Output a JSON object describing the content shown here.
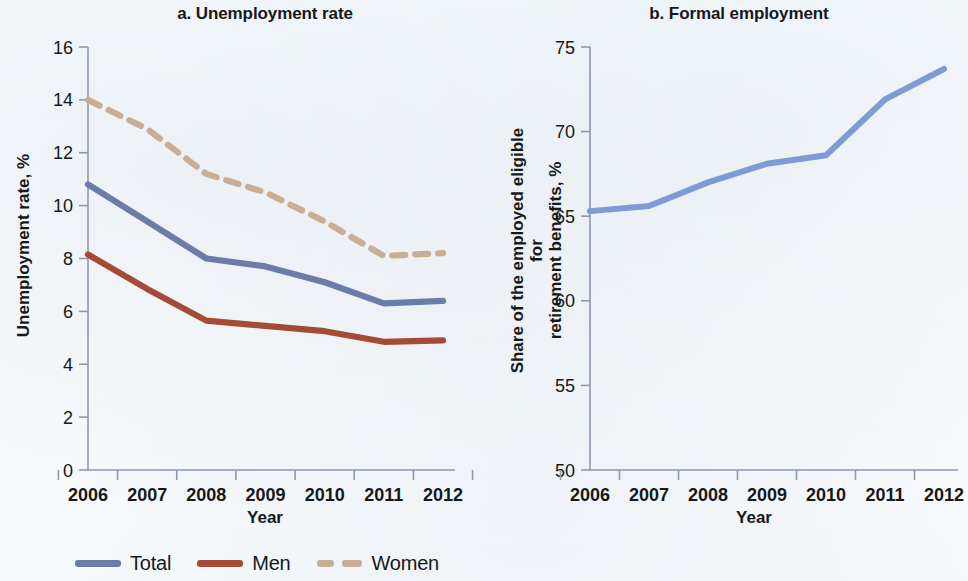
{
  "figure": {
    "background_color": "#fbfcfd",
    "x_axis_label": "Year"
  },
  "panels": [
    {
      "id": "a",
      "title": "a. Unemployment rate",
      "ylabel": "Unemployment rate, %",
      "xlabel": "Year"
    },
    {
      "id": "b",
      "title": "b. Formal employment",
      "ylabel_line1": "Share of the employed eligible for",
      "ylabel_line2": "retirement benefits, %",
      "xlabel": "Year"
    }
  ],
  "legend": {
    "items": [
      {
        "label": "Total",
        "color": "#6B7CA8",
        "style": "solid"
      },
      {
        "label": "Men",
        "color": "#A44A35",
        "style": "solid"
      },
      {
        "label": "Women",
        "color": "#C9AE96",
        "style": "dashed"
      }
    ]
  },
  "chart_data": [
    {
      "type": "line",
      "title": "a. Unemployment rate",
      "xlabel": "Year",
      "ylabel": "Unemployment rate, %",
      "categories": [
        "2006",
        "2007",
        "2008",
        "2009",
        "2010",
        "2011",
        "2012"
      ],
      "x": [
        2006,
        2007,
        2008,
        2009,
        2010,
        2011,
        2012
      ],
      "xlim": [
        2006,
        2012
      ],
      "ylim": [
        0,
        16
      ],
      "yticks": [
        0,
        2,
        4,
        6,
        8,
        10,
        12,
        14,
        16
      ],
      "grid": false,
      "legend_position": "bottom",
      "series": [
        {
          "name": "Total",
          "color": "#6B7CA8",
          "style": "solid",
          "values": [
            10.8,
            9.4,
            8.0,
            7.7,
            7.1,
            6.3,
            6.4
          ]
        },
        {
          "name": "Men",
          "color": "#A44A35",
          "style": "solid",
          "values": [
            8.15,
            6.85,
            5.65,
            5.45,
            5.25,
            4.85,
            4.9
          ]
        },
        {
          "name": "Women",
          "color": "#C9AE96",
          "style": "dashed",
          "values": [
            14.0,
            12.9,
            11.2,
            10.5,
            9.4,
            8.1,
            8.2
          ]
        }
      ]
    },
    {
      "type": "line",
      "title": "b. Formal employment",
      "xlabel": "Year",
      "ylabel": "Share of the employed eligible for retirement benefits, %",
      "categories": [
        "2006",
        "2007",
        "2008",
        "2009",
        "2010",
        "2011",
        "2012"
      ],
      "x": [
        2006,
        2007,
        2008,
        2009,
        2010,
        2011,
        2012
      ],
      "xlim": [
        2006,
        2012
      ],
      "ylim": [
        50,
        75
      ],
      "yticks": [
        50,
        55,
        60,
        65,
        70,
        75
      ],
      "grid": false,
      "legend_position": "none",
      "series": [
        {
          "name": "Share of the employed eligible for retirement benefits",
          "color": "#7D9BD4",
          "style": "solid",
          "values": [
            65.3,
            65.6,
            67.0,
            68.1,
            68.6,
            71.9,
            73.7
          ]
        }
      ]
    }
  ]
}
